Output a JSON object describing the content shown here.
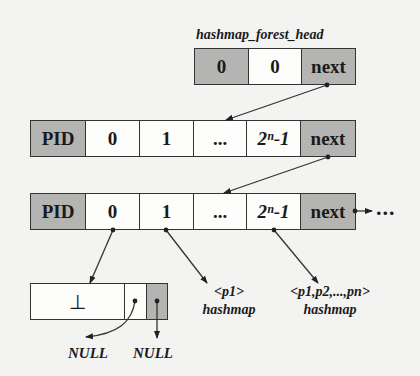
{
  "head": {
    "title": "hashmap_forest_head",
    "cells": [
      {
        "text": "0",
        "shaded": true
      },
      {
        "text": "0",
        "shaded": false
      },
      {
        "text": "next",
        "shaded": true
      }
    ]
  },
  "nodes": [
    {
      "cells": [
        {
          "text": "PID",
          "shaded": true
        },
        {
          "text": "0"
        },
        {
          "text": "1"
        },
        {
          "text": "..."
        },
        {
          "text": "2ⁿ-1",
          "italic": true
        },
        {
          "text": "next",
          "shaded": true
        }
      ]
    },
    {
      "cells": [
        {
          "text": "PID",
          "shaded": true
        },
        {
          "text": "0"
        },
        {
          "text": "1"
        },
        {
          "text": "..."
        },
        {
          "text": "2ⁿ-1",
          "italic": true
        },
        {
          "text": "next",
          "shaded": true
        }
      ],
      "continuation": "..."
    }
  ],
  "leaf_node": {
    "cells": [
      {
        "text": "⊥"
      },
      {
        "text": ""
      },
      {
        "text": "",
        "shaded": true
      }
    ],
    "null_labels": [
      "NULL",
      "NULL"
    ]
  },
  "hashmaps": [
    {
      "keys": "<p1>",
      "label": "hashmap"
    },
    {
      "keys": "<p1,p2,...,pn>",
      "label": "hashmap"
    }
  ]
}
